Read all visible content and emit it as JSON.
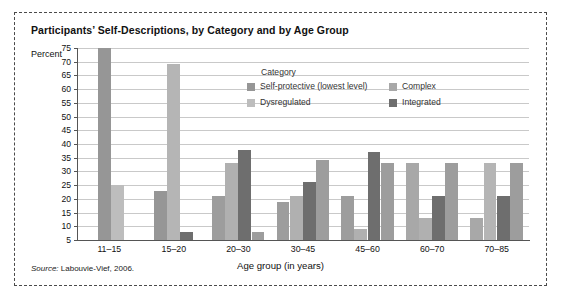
{
  "figure": {
    "title": "Participants’ Self-Descriptions, by Category and by Age Group",
    "y_axis_label": "Percent",
    "x_axis_label": "Age group (in years)",
    "source_prefix": "Source:",
    "source_text": "Labouvie-Vief, 2006."
  },
  "legend": {
    "title": "Category",
    "items": [
      {
        "label": "Self-protective (lowest level)",
        "color": "#969696"
      },
      {
        "label": "Complex",
        "color": "#a8a8a8"
      },
      {
        "label": "Dysregulated",
        "color": "#bdbdbd"
      },
      {
        "label": "Integrated",
        "color": "#6e6e6e"
      }
    ]
  },
  "chart_data": {
    "type": "bar",
    "title": "Participants’ Self-Descriptions, by Category and by Age Group",
    "xlabel": "Age group (in years)",
    "ylabel": "Percent",
    "ylim": [
      5,
      75
    ],
    "ytick_step": 5,
    "yticks": [
      75,
      70,
      65,
      60,
      55,
      50,
      45,
      40,
      35,
      30,
      25,
      20,
      15,
      10,
      5
    ],
    "grid": true,
    "legend_position": "inside-top-center",
    "categories": [
      "11–15",
      "15–20",
      "20–30",
      "30–45",
      "45–60",
      "60–70",
      "70–85"
    ],
    "series": [
      {
        "name": "Self-protective (lowest level)",
        "color": "#969696",
        "values": [
          75,
          23,
          21,
          19,
          21,
          33,
          13
        ]
      },
      {
        "name": "Complex",
        "color": "#a8a8a8",
        "values": [
          null,
          69,
          33,
          21,
          9,
          13,
          33
        ]
      },
      {
        "name": "Dysregulated",
        "color": "#bdbdbd",
        "values": [
          25,
          null,
          null,
          null,
          null,
          null,
          null
        ]
      },
      {
        "name": "Integrated",
        "color": "#6e6e6e",
        "values": [
          null,
          8,
          38,
          26,
          37,
          21,
          21
        ]
      }
    ],
    "bars": [
      {
        "group": "11–15",
        "slots": [
          {
            "category": "Self-protective (lowest level)",
            "value": 75,
            "color": "#969696"
          },
          {
            "category": "Dysregulated",
            "value": 25,
            "color": "#bdbdbd"
          }
        ]
      },
      {
        "group": "15–20",
        "slots": [
          {
            "category": "Self-protective (lowest level)",
            "value": 23,
            "color": "#969696"
          },
          {
            "category": "Complex",
            "value": 69,
            "color": "#b5b5b5"
          },
          {
            "category": "Integrated",
            "value": 8,
            "color": "#6e6e6e"
          }
        ]
      },
      {
        "group": "20–30",
        "slots": [
          {
            "category": "Self-protective (lowest level)",
            "value": 21,
            "color": "#9d9d9d"
          },
          {
            "category": "Complex",
            "value": 33,
            "color": "#b0b0b0"
          },
          {
            "category": "Integrated",
            "value": 38,
            "color": "#6e6e6e"
          },
          {
            "category": "Dysregulated",
            "value": 8,
            "color": "#9d9d9d"
          }
        ]
      },
      {
        "group": "30–45",
        "slots": [
          {
            "category": "Self-protective (lowest level)",
            "value": 19,
            "color": "#9d9d9d"
          },
          {
            "category": "Complex",
            "value": 21,
            "color": "#b0b0b0"
          },
          {
            "category": "Integrated",
            "value": 26,
            "color": "#6e6e6e"
          },
          {
            "category": "Dysregulated",
            "value": 34,
            "color": "#9d9d9d"
          }
        ]
      },
      {
        "group": "45–60",
        "slots": [
          {
            "category": "Self-protective (lowest level)",
            "value": 21,
            "color": "#9d9d9d"
          },
          {
            "category": "Complex",
            "value": 9,
            "color": "#b0b0b0"
          },
          {
            "category": "Integrated",
            "value": 37,
            "color": "#6e6e6e"
          },
          {
            "category": "Dysregulated",
            "value": 33,
            "color": "#9d9d9d"
          }
        ]
      },
      {
        "group": "60–70",
        "slots": [
          {
            "category": "Self-protective (lowest level)",
            "value": 33,
            "color": "#a8a8a8"
          },
          {
            "category": "Complex",
            "value": 13,
            "color": "#b0b0b0"
          },
          {
            "category": "Integrated",
            "value": 21,
            "color": "#6e6e6e"
          },
          {
            "category": "Dysregulated",
            "value": 33,
            "color": "#9d9d9d"
          }
        ]
      },
      {
        "group": "70–85",
        "slots": [
          {
            "category": "Self-protective (lowest level)",
            "value": 13,
            "color": "#a8a8a8"
          },
          {
            "category": "Complex",
            "value": 33,
            "color": "#b5b5b5"
          },
          {
            "category": "Integrated",
            "value": 21,
            "color": "#6e6e6e"
          },
          {
            "category": "Dysregulated",
            "value": 33,
            "color": "#9d9d9d"
          }
        ]
      }
    ]
  }
}
